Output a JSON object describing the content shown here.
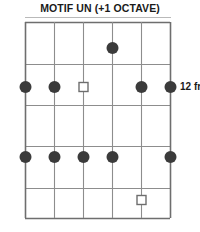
{
  "title": "MOTIF UN (+1 OCTAVE)",
  "labels": {
    "right_fret": "12 fr",
    "left_fret_clipped": "r"
  },
  "colors": {
    "ink": "#1a1a1a",
    "grid": "#8d8d8d",
    "border": "#6e6e6e",
    "marker_fill": "#3b3b3b",
    "marker_open_stroke": "#6e6e6e",
    "background": "#ffffff",
    "rule": "#b9b9b9"
  },
  "chart_data": {
    "type": "diagram",
    "diagram_kind": "guitar-fretboard-chord-diagram",
    "title": "MOTIF UN (+1 OCTAVE)",
    "orientation": "vertical",
    "string_count": 6,
    "fret_count": 5,
    "position_label": "12 fr",
    "position_label_side": "right",
    "position_label_fret_line": 2,
    "grid": {
      "left_x": 25,
      "right_x": 170,
      "top_y": 22,
      "bottom_y": 218,
      "string_x": [
        25,
        54,
        83,
        112,
        141,
        170
      ],
      "fret_y": [
        22,
        64,
        105,
        146,
        188,
        218
      ]
    },
    "markers": [
      {
        "id": "m1",
        "string": 4,
        "fret_cell": 1,
        "y": 48,
        "x": 112,
        "shape": "filled-dot",
        "radius": 6.0
      },
      {
        "id": "m2",
        "string": 1,
        "fret_line": 2,
        "y": 87,
        "x": 25,
        "shape": "filled-dot",
        "radius": 6.0
      },
      {
        "id": "m3",
        "string": 2,
        "fret_line": 2,
        "y": 87,
        "x": 54,
        "shape": "filled-dot",
        "radius": 6.0
      },
      {
        "id": "m4",
        "string": 3,
        "fret_line": 2,
        "y": 87,
        "x": 83,
        "shape": "open-square",
        "size": 9.0
      },
      {
        "id": "m5",
        "string": 5,
        "fret_line": 2,
        "y": 87,
        "x": 141,
        "shape": "filled-dot",
        "radius": 6.0
      },
      {
        "id": "m6",
        "string": 6,
        "fret_line": 2,
        "y": 87,
        "x": 170,
        "shape": "filled-dot",
        "radius": 6.0
      },
      {
        "id": "m7",
        "string": 1,
        "fret_line": 4,
        "y": 157,
        "x": 25,
        "shape": "filled-dot",
        "radius": 6.0
      },
      {
        "id": "m8",
        "string": 2,
        "fret_line": 4,
        "y": 157,
        "x": 54,
        "shape": "filled-dot",
        "radius": 6.0
      },
      {
        "id": "m9",
        "string": 3,
        "fret_line": 4,
        "y": 157,
        "x": 83,
        "shape": "filled-dot",
        "radius": 6.0
      },
      {
        "id": "m10",
        "string": 4,
        "fret_line": 4,
        "y": 157,
        "x": 112,
        "shape": "filled-dot",
        "radius": 6.0
      },
      {
        "id": "m11",
        "string": 6,
        "fret_line": 4,
        "y": 157,
        "x": 170,
        "shape": "filled-dot",
        "radius": 6.0
      },
      {
        "id": "m12",
        "string": 5,
        "fret_cell": 5,
        "y": 200,
        "x": 141,
        "shape": "open-square",
        "size": 9.0
      }
    ]
  }
}
